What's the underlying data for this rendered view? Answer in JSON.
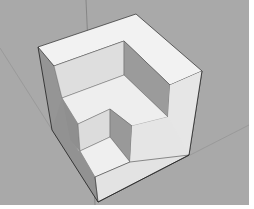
{
  "scene": {
    "description": "3D model viewport showing a stepped cube with an L-shaped notch",
    "colors": {
      "background": "#a9a9a9",
      "border": "#ffffff",
      "face_light": "#efefef",
      "face_mid": "#dcdcdc",
      "face_shadow": "#8f8f8f",
      "face_dark": "#9a9a9a",
      "edge": "#2a2a2a",
      "axis": "#7a7a7a"
    }
  }
}
